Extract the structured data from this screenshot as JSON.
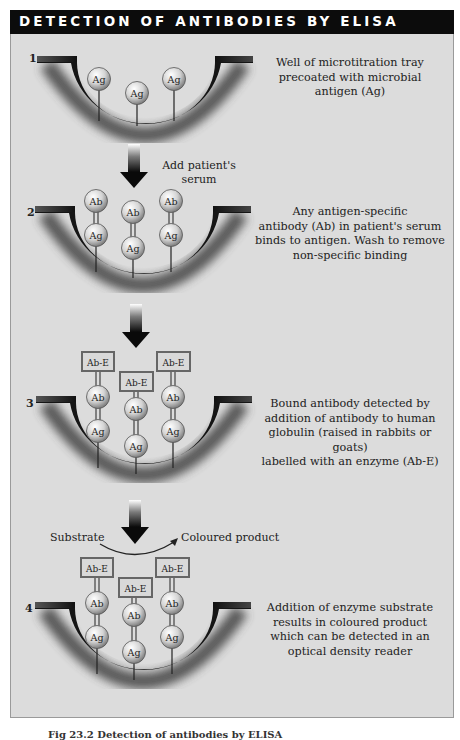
{
  "title": "DETECTION OF ANTIBODIES BY ELISA",
  "steps": [
    {
      "number": "1",
      "description": "Well of microtitration tray precoated with microbial antigen (Ag)",
      "description_lines": [
        "Well of microtitration tray",
        "precoated with microbial",
        "antigen (Ag)"
      ]
    },
    {
      "number": "2",
      "description": "Any antigen-specific antibody (Ab) in patient's serum binds to antigen. Wash to remove non-specific binding",
      "description_lines": [
        "Any antigen-specific",
        "antibody (Ab) in patient's serum",
        "binds to antigen. Wash to remove",
        "non-specific binding"
      ]
    },
    {
      "number": "3",
      "description": "Bound antibody detected by addition of antibody to human globulin (raised in rabbits or goats) labelled with an enzyme (Ab-E)",
      "description_lines": [
        "Bound antibody detected by",
        "addition of antibody to human",
        "globulin (raised in rabbits or goats)",
        "labelled with an enzyme (Ab-E)"
      ]
    },
    {
      "number": "4",
      "description": "Addition of enzyme substrate results in coloured product which can be detected in an optical density reader",
      "description_lines": [
        "Addition of enzyme substrate",
        "results in coloured product",
        "which can be detected in an",
        "optical density reader"
      ]
    }
  ],
  "arrows": {
    "step1_to_2_label_lines": [
      "Add patient's",
      "serum"
    ],
    "step3_to_4_substrate": "Substrate",
    "step3_to_4_product": "Coloured product"
  },
  "labels": {
    "antigen": "Ag",
    "antibody": "Ab",
    "enzyme_antibody": "Ab-E"
  },
  "caption": "Fig 23.2 Detection of antibodies by ELISA",
  "colors": {
    "title_bar": "#0c0c0c",
    "panel_bg": "#dcdcdc",
    "well_dark": "#1a1a1a",
    "ball_fill": "#d8d8d8"
  }
}
